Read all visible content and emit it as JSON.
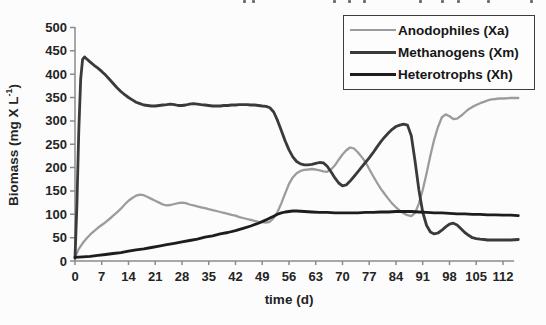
{
  "figure": {
    "ylabel_prefix": "Biomass (mg X L",
    "ylabel_sup": "-1",
    "ylabel_suffix": ")",
    "xlabel": "time (d)"
  },
  "legend": {
    "items": [
      {
        "label": "Anodophiles (Xa)",
        "color": "#9c9c9c",
        "sample_height": 2
      },
      {
        "label": "Methanogens (Xm)",
        "color": "#3a3a3a",
        "sample_height": 3
      },
      {
        "label": "Heterotrophs (Xh)",
        "color": "#1d1d1d",
        "sample_height": 3
      }
    ]
  },
  "scan_artifacts": {
    "top_edge_marks": [
      243,
      252,
      333,
      348,
      363,
      419,
      441,
      457,
      487,
      530
    ]
  },
  "chart_data": {
    "type": "line",
    "title": "",
    "xlabel": "time (d)",
    "ylabel": "Biomass (mg X L^-1)",
    "xlim": [
      0,
      116
    ],
    "ylim": [
      0,
      500
    ],
    "x_ticks": [
      0,
      7,
      14,
      21,
      28,
      35,
      42,
      49,
      56,
      63,
      70,
      77,
      84,
      91,
      98,
      105,
      112
    ],
    "y_ticks": [
      0,
      50,
      100,
      150,
      200,
      250,
      300,
      350,
      400,
      450,
      500
    ],
    "grid": false,
    "legend_position": "top-right",
    "axis_color": "#8a8a8a",
    "series": [
      {
        "id": "anodophiles",
        "name": "Anodophiles (Xa)",
        "color": "#9c9c9c",
        "width": 2.3,
        "points": [
          [
            0,
            8
          ],
          [
            1,
            26
          ],
          [
            2,
            38
          ],
          [
            3,
            48
          ],
          [
            4,
            57
          ],
          [
            5,
            64
          ],
          [
            6,
            71
          ],
          [
            7,
            77
          ],
          [
            8,
            83
          ],
          [
            9,
            90
          ],
          [
            10,
            97
          ],
          [
            11,
            104
          ],
          [
            12,
            112
          ],
          [
            13,
            121
          ],
          [
            14,
            129
          ],
          [
            15,
            135
          ],
          [
            16,
            140
          ],
          [
            17,
            142
          ],
          [
            18,
            141
          ],
          [
            19,
            137
          ],
          [
            20,
            133
          ],
          [
            21,
            129
          ],
          [
            22,
            125
          ],
          [
            23,
            121
          ],
          [
            24,
            119
          ],
          [
            25,
            120
          ],
          [
            26,
            122
          ],
          [
            27,
            124
          ],
          [
            28,
            125
          ],
          [
            29,
            124
          ],
          [
            30,
            121
          ],
          [
            31,
            119
          ],
          [
            32,
            117
          ],
          [
            33,
            115
          ],
          [
            34,
            113
          ],
          [
            35,
            111
          ],
          [
            36,
            109
          ],
          [
            37,
            107
          ],
          [
            38,
            105
          ],
          [
            39,
            103
          ],
          [
            40,
            101
          ],
          [
            41,
            99
          ],
          [
            42,
            97
          ],
          [
            43,
            94
          ],
          [
            44,
            92
          ],
          [
            45,
            90
          ],
          [
            46,
            88
          ],
          [
            47,
            86
          ],
          [
            48,
            84
          ],
          [
            49,
            83
          ],
          [
            50,
            82
          ],
          [
            51,
            84
          ],
          [
            52,
            92
          ],
          [
            53,
            105
          ],
          [
            54,
            124
          ],
          [
            55,
            145
          ],
          [
            56,
            165
          ],
          [
            57,
            179
          ],
          [
            58,
            188
          ],
          [
            59,
            193
          ],
          [
            60,
            195
          ],
          [
            61,
            196
          ],
          [
            62,
            197
          ],
          [
            63,
            196
          ],
          [
            64,
            194
          ],
          [
            65,
            192
          ],
          [
            66,
            191
          ],
          [
            67,
            196
          ],
          [
            68,
            205
          ],
          [
            69,
            217
          ],
          [
            70,
            228
          ],
          [
            71,
            237
          ],
          [
            72,
            243
          ],
          [
            73,
            241
          ],
          [
            74,
            233
          ],
          [
            75,
            223
          ],
          [
            76,
            212
          ],
          [
            77,
            197
          ],
          [
            78,
            182
          ],
          [
            79,
            168
          ],
          [
            80,
            155
          ],
          [
            81,
            144
          ],
          [
            82,
            133
          ],
          [
            83,
            123
          ],
          [
            84,
            115
          ],
          [
            85,
            108
          ],
          [
            86,
            102
          ],
          [
            87,
            98
          ],
          [
            88,
            96
          ],
          [
            89,
            103
          ],
          [
            90,
            123
          ],
          [
            91,
            152
          ],
          [
            92,
            188
          ],
          [
            93,
            226
          ],
          [
            94,
            260
          ],
          [
            95,
            287
          ],
          [
            96,
            308
          ],
          [
            97,
            314
          ],
          [
            98,
            310
          ],
          [
            99,
            304
          ],
          [
            100,
            305
          ],
          [
            101,
            311
          ],
          [
            102,
            318
          ],
          [
            103,
            325
          ],
          [
            104,
            330
          ],
          [
            105,
            334
          ],
          [
            106,
            338
          ],
          [
            107,
            341
          ],
          [
            108,
            344
          ],
          [
            109,
            346
          ],
          [
            110,
            347
          ],
          [
            111,
            348
          ],
          [
            112,
            348
          ],
          [
            114,
            349
          ],
          [
            116,
            349
          ]
        ]
      },
      {
        "id": "methanogens",
        "name": "Methanogens (Xm)",
        "color": "#3a3a3a",
        "width": 2.8,
        "points": [
          [
            0,
            6
          ],
          [
            0.5,
            120
          ],
          [
            1,
            280
          ],
          [
            1.5,
            390
          ],
          [
            2,
            432
          ],
          [
            2.5,
            437
          ],
          [
            3,
            433
          ],
          [
            4,
            426
          ],
          [
            5,
            419
          ],
          [
            6,
            413
          ],
          [
            7,
            406
          ],
          [
            8,
            398
          ],
          [
            9,
            389
          ],
          [
            10,
            380
          ],
          [
            11,
            371
          ],
          [
            12,
            363
          ],
          [
            13,
            356
          ],
          [
            14,
            350
          ],
          [
            15,
            345
          ],
          [
            16,
            340
          ],
          [
            17,
            337
          ],
          [
            18,
            334
          ],
          [
            19,
            333
          ],
          [
            20,
            332
          ],
          [
            21,
            332
          ],
          [
            22,
            333
          ],
          [
            23,
            334
          ],
          [
            24,
            335
          ],
          [
            25,
            336
          ],
          [
            26,
            335
          ],
          [
            27,
            333
          ],
          [
            28,
            333
          ],
          [
            29,
            334
          ],
          [
            30,
            336
          ],
          [
            31,
            337
          ],
          [
            32,
            336
          ],
          [
            33,
            335
          ],
          [
            34,
            334
          ],
          [
            35,
            333
          ],
          [
            36,
            332
          ],
          [
            37,
            332
          ],
          [
            38,
            332
          ],
          [
            39,
            333
          ],
          [
            40,
            333
          ],
          [
            41,
            334
          ],
          [
            42,
            334
          ],
          [
            43,
            335
          ],
          [
            44,
            335
          ],
          [
            45,
            335
          ],
          [
            46,
            334
          ],
          [
            47,
            334
          ],
          [
            48,
            333
          ],
          [
            49,
            332
          ],
          [
            50,
            331
          ],
          [
            51,
            328
          ],
          [
            52,
            319
          ],
          [
            53,
            301
          ],
          [
            54,
            279
          ],
          [
            55,
            257
          ],
          [
            56,
            238
          ],
          [
            57,
            223
          ],
          [
            58,
            213
          ],
          [
            59,
            208
          ],
          [
            60,
            206
          ],
          [
            61,
            206
          ],
          [
            62,
            207
          ],
          [
            63,
            209
          ],
          [
            64,
            211
          ],
          [
            65,
            210
          ],
          [
            66,
            203
          ],
          [
            67,
            191
          ],
          [
            68,
            178
          ],
          [
            69,
            167
          ],
          [
            70,
            161
          ],
          [
            71,
            163
          ],
          [
            72,
            171
          ],
          [
            73,
            181
          ],
          [
            74,
            191
          ],
          [
            75,
            201
          ],
          [
            76,
            211
          ],
          [
            77,
            221
          ],
          [
            78,
            232
          ],
          [
            79,
            244
          ],
          [
            80,
            255
          ],
          [
            81,
            265
          ],
          [
            82,
            274
          ],
          [
            83,
            282
          ],
          [
            84,
            288
          ],
          [
            85,
            291
          ],
          [
            86,
            293
          ],
          [
            87,
            291
          ],
          [
            88,
            268
          ],
          [
            89,
            213
          ],
          [
            90,
            152
          ],
          [
            91,
            105
          ],
          [
            92,
            76
          ],
          [
            93,
            62
          ],
          [
            94,
            58
          ],
          [
            95,
            60
          ],
          [
            96,
            66
          ],
          [
            97,
            73
          ],
          [
            98,
            79
          ],
          [
            99,
            81
          ],
          [
            100,
            77
          ],
          [
            101,
            69
          ],
          [
            102,
            61
          ],
          [
            103,
            55
          ],
          [
            104,
            50
          ],
          [
            105,
            48
          ],
          [
            106,
            47
          ],
          [
            107,
            46
          ],
          [
            108,
            45
          ],
          [
            110,
            45
          ],
          [
            112,
            45
          ],
          [
            114,
            45
          ],
          [
            116,
            46
          ]
        ]
      },
      {
        "id": "heterotrophs",
        "name": "Heterotrophs (Xh)",
        "color": "#1d1d1d",
        "width": 2.8,
        "points": [
          [
            0,
            8
          ],
          [
            2,
            9
          ],
          [
            4,
            10
          ],
          [
            6,
            12
          ],
          [
            8,
            14
          ],
          [
            10,
            16
          ],
          [
            12,
            18
          ],
          [
            14,
            21
          ],
          [
            16,
            24
          ],
          [
            18,
            26
          ],
          [
            20,
            29
          ],
          [
            22,
            32
          ],
          [
            24,
            35
          ],
          [
            26,
            38
          ],
          [
            28,
            41
          ],
          [
            30,
            44
          ],
          [
            32,
            47
          ],
          [
            34,
            51
          ],
          [
            36,
            54
          ],
          [
            38,
            58
          ],
          [
            40,
            61
          ],
          [
            42,
            65
          ],
          [
            44,
            70
          ],
          [
            46,
            75
          ],
          [
            48,
            81
          ],
          [
            50,
            88
          ],
          [
            51,
            92
          ],
          [
            52,
            96
          ],
          [
            53,
            100
          ],
          [
            54,
            103
          ],
          [
            55,
            105
          ],
          [
            56,
            106
          ],
          [
            57,
            107
          ],
          [
            58,
            107
          ],
          [
            60,
            106
          ],
          [
            62,
            105
          ],
          [
            64,
            104
          ],
          [
            66,
            104
          ],
          [
            68,
            103
          ],
          [
            70,
            103
          ],
          [
            72,
            103
          ],
          [
            74,
            103
          ],
          [
            76,
            104
          ],
          [
            78,
            104
          ],
          [
            80,
            105
          ],
          [
            82,
            105
          ],
          [
            84,
            106
          ],
          [
            86,
            106
          ],
          [
            88,
            106
          ],
          [
            90,
            105
          ],
          [
            92,
            104
          ],
          [
            94,
            103
          ],
          [
            96,
            103
          ],
          [
            98,
            102
          ],
          [
            100,
            101
          ],
          [
            102,
            101
          ],
          [
            104,
            100
          ],
          [
            106,
            100
          ],
          [
            108,
            99
          ],
          [
            110,
            99
          ],
          [
            112,
            98
          ],
          [
            114,
            98
          ],
          [
            116,
            97
          ]
        ]
      }
    ]
  }
}
